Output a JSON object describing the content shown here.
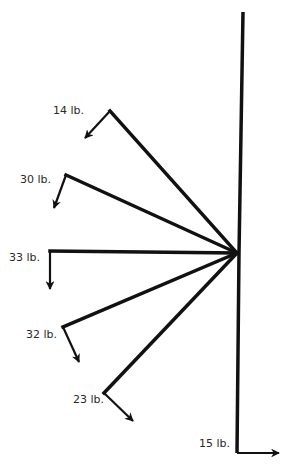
{
  "diagram": {
    "type": "force-vectors",
    "stroke_color": "#111111",
    "hub": {
      "x": 237,
      "y": 253
    },
    "top_of_post": {
      "x": 243,
      "y": 12
    },
    "forces": [
      {
        "label": "14 lb.",
        "vertex": {
          "x": 110,
          "y": 111
        },
        "tip": {
          "x": 85,
          "y": 138
        },
        "label_pos": {
          "x": 53,
          "y": 111
        }
      },
      {
        "label": "30 lb.",
        "vertex": {
          "x": 66,
          "y": 175
        },
        "tip": {
          "x": 54,
          "y": 208
        },
        "label_pos": {
          "x": 20,
          "y": 180
        }
      },
      {
        "label": "33 lb.",
        "vertex": {
          "x": 50,
          "y": 251
        },
        "tip": {
          "x": 50,
          "y": 289
        },
        "label_pos": {
          "x": 9,
          "y": 258
        }
      },
      {
        "label": "32 lb.",
        "vertex": {
          "x": 63,
          "y": 327
        },
        "tip": {
          "x": 79,
          "y": 362
        },
        "label_pos": {
          "x": 26,
          "y": 335
        }
      },
      {
        "label": "23 lb.",
        "vertex": {
          "x": 104,
          "y": 393
        },
        "tip": {
          "x": 133,
          "y": 421
        },
        "label_pos": {
          "x": 73,
          "y": 400
        }
      },
      {
        "label": "15 lb.",
        "vertex": {
          "x": 237,
          "y": 453
        },
        "tip": {
          "x": 279,
          "y": 453
        },
        "label_pos": {
          "x": 199,
          "y": 444
        }
      }
    ]
  }
}
